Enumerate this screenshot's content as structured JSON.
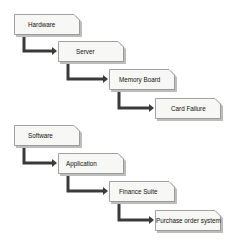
{
  "separator_label": "Or",
  "colors": {
    "box_fill": "#f7f7f5",
    "box_border": "#8a8a8a",
    "box_shadow": "#bdbdbd",
    "arrow": "#3a3a3a"
  },
  "chains": [
    {
      "nodes": [
        {
          "label": "Hardware",
          "x": 14,
          "y": 14,
          "text_offset": 14
        },
        {
          "label": "Server",
          "x": 58,
          "y": 41,
          "text_offset": 18
        },
        {
          "label": "Memory Board",
          "x": 109,
          "y": 69,
          "text_offset": 10
        },
        {
          "label": "Card Failure",
          "x": 155,
          "y": 98,
          "text_offset": 16
        }
      ]
    },
    {
      "nodes": [
        {
          "label": "Software",
          "x": 14,
          "y": 125,
          "text_offset": 14
        },
        {
          "label": "Application",
          "x": 58,
          "y": 153,
          "text_offset": 8
        },
        {
          "label": "Finance Suite",
          "x": 109,
          "y": 181,
          "text_offset": 10
        },
        {
          "label": "Purchase order system",
          "x": 155,
          "y": 210,
          "text_offset": 1
        }
      ]
    }
  ]
}
